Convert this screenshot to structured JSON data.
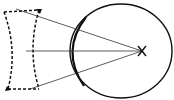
{
  "diagram": {
    "title": "",
    "colors": {
      "background": "#ffffff",
      "stroke": "#111111",
      "ray": "#333333"
    },
    "elements": {
      "lens": {
        "type": "concave-lens",
        "style": "dashed"
      },
      "eye": {
        "type": "circle"
      },
      "focal_point": {
        "marker": "X"
      },
      "rays": [
        {
          "from": [
            16,
            9
          ],
          "to": [
            142,
            51
          ]
        },
        {
          "from": [
            26,
            51
          ],
          "to": [
            142,
            51
          ]
        },
        {
          "from": [
            30,
            89
          ],
          "to": [
            142,
            51
          ]
        }
      ]
    }
  }
}
